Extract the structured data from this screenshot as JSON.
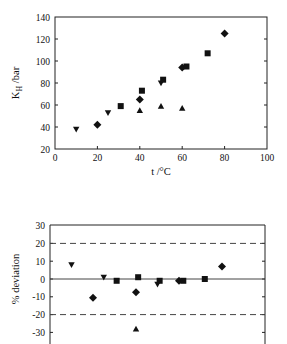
{
  "chart_data": [
    {
      "type": "scatter",
      "title": "",
      "xlabel": "t /°C",
      "ylabel": "K_H /bar",
      "ylabel_main": "K",
      "ylabel_sub": "H",
      "ylabel_unit": " /bar",
      "xlim": [
        0,
        100
      ],
      "ylim": [
        20,
        140
      ],
      "xticks": [
        0,
        20,
        40,
        60,
        80,
        100
      ],
      "yticks": [
        20,
        40,
        60,
        80,
        100,
        120,
        140
      ],
      "grid": false,
      "legend": "none",
      "series": [
        {
          "name": "inverted-triangle",
          "marker": "triangle-down",
          "points": [
            [
              10,
              38
            ],
            [
              25,
              53
            ],
            [
              50,
              80
            ]
          ]
        },
        {
          "name": "diamond",
          "marker": "diamond",
          "points": [
            [
              20,
              42
            ],
            [
              40,
              65
            ],
            [
              60,
              94
            ],
            [
              80,
              125
            ]
          ]
        },
        {
          "name": "square",
          "marker": "square",
          "points": [
            [
              31,
              59
            ],
            [
              41,
              73
            ],
            [
              51,
              83
            ],
            [
              62,
              95
            ],
            [
              72,
              107
            ]
          ]
        },
        {
          "name": "triangle",
          "marker": "triangle-up",
          "points": [
            [
              40,
              55
            ],
            [
              50,
              59
            ],
            [
              60,
              57
            ]
          ]
        }
      ]
    },
    {
      "type": "scatter",
      "title": "",
      "xlabel": "",
      "ylabel": "% deviation",
      "xlim": [
        0,
        100
      ],
      "ylim": [
        -35,
        30
      ],
      "yticks": [
        30,
        20,
        10,
        0,
        -10,
        -20,
        -30
      ],
      "grid": false,
      "legend": "none",
      "reference_lines": [
        {
          "y": 20,
          "style": "dashed"
        },
        {
          "y": 0,
          "style": "solid"
        },
        {
          "y": -20,
          "style": "dashed"
        }
      ],
      "series": [
        {
          "name": "inverted-triangle",
          "marker": "triangle-down",
          "points": [
            [
              10,
              8
            ],
            [
              25,
              1
            ],
            [
              50,
              -3
            ]
          ]
        },
        {
          "name": "diamond",
          "marker": "diamond",
          "points": [
            [
              20,
              -10.5
            ],
            [
              40,
              -7.5
            ],
            [
              60,
              -1
            ],
            [
              80,
              7
            ]
          ]
        },
        {
          "name": "square",
          "marker": "square",
          "points": [
            [
              31,
              -1
            ],
            [
              41,
              1
            ],
            [
              51,
              -1
            ],
            [
              62,
              -1
            ],
            [
              72,
              0
            ]
          ]
        },
        {
          "name": "triangle",
          "marker": "triangle-up",
          "points": [
            [
              40,
              -28
            ]
          ]
        }
      ]
    }
  ]
}
